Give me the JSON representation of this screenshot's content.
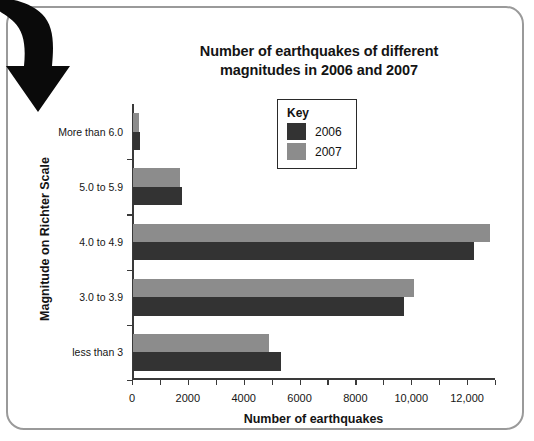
{
  "frame": {
    "border_color": "#9a9a9a"
  },
  "decoration": {
    "arrow_icon": "curved-down-arrow",
    "color": "#0a0a0a"
  },
  "chart_data": {
    "type": "bar",
    "orientation": "horizontal",
    "title": "Number of earthquakes of different magnitudes in 2006 and 2007",
    "title_line1": "Number of earthquakes of different",
    "title_line2": "magnitudes in 2006 and 2007",
    "xlabel": "Number of earthquakes",
    "ylabel": "Magnitude on Richter Scale",
    "categories": [
      "More than 6.0",
      "5.0 to 5.9",
      "4.0 to 4.9",
      "3.0 to 3.9",
      "less than 3"
    ],
    "series": [
      {
        "name": "2006",
        "color": "#333333",
        "values": [
          240,
          1750,
          12200,
          9700,
          5300
        ]
      },
      {
        "name": "2007",
        "color": "#8c8c8c",
        "values": [
          200,
          1700,
          12800,
          10050,
          4880
        ]
      }
    ],
    "xlim": [
      0,
      13000
    ],
    "xticks": [
      0,
      1000,
      2000,
      3000,
      4000,
      5000,
      6000,
      7000,
      8000,
      9000,
      10000,
      11000,
      12000,
      13000
    ],
    "xtick_labels": [
      {
        "value": 0,
        "label": "0"
      },
      {
        "value": 2000,
        "label": "2000"
      },
      {
        "value": 4000,
        "label": "4000"
      },
      {
        "value": 6000,
        "label": "6000"
      },
      {
        "value": 8000,
        "label": "8000"
      },
      {
        "value": 10000,
        "label": "10,000"
      },
      {
        "value": 12000,
        "label": "12,000"
      }
    ],
    "grid": false,
    "legend": {
      "title": "Key",
      "position": "inside-top-center",
      "entries": [
        "2006",
        "2007"
      ]
    }
  }
}
